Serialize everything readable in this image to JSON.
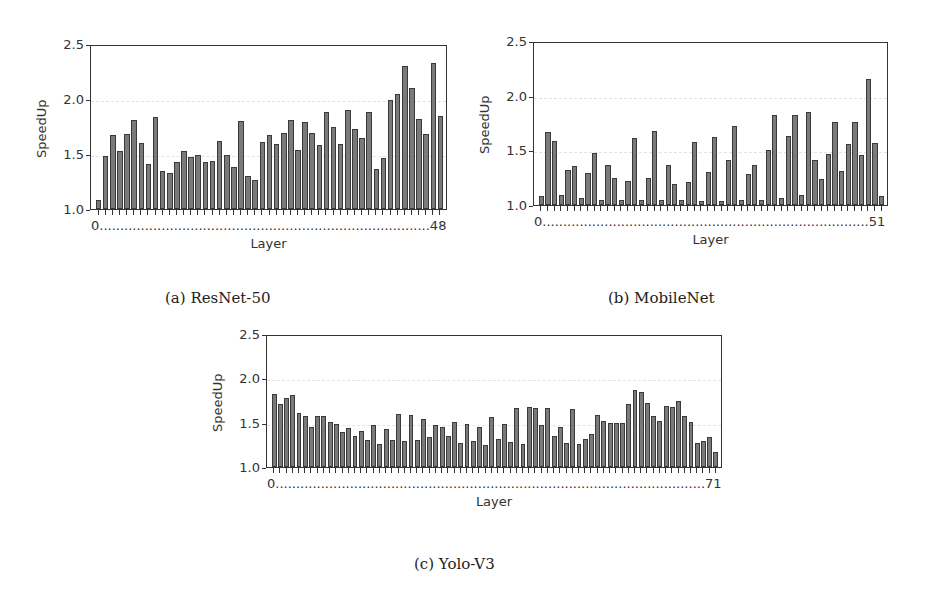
{
  "figure": {
    "captions": [
      "(a) ResNet-50",
      "(b) MobileNet",
      "(c) Yolo-V3"
    ]
  },
  "chart_data": [
    {
      "type": "bar",
      "title": "ResNet-50",
      "caption": "(a) ResNet-50",
      "xlabel": "Layer",
      "ylabel": "SpeedUp",
      "ylim": [
        1.0,
        2.5
      ],
      "yticks": [
        "1.0",
        "1.5",
        "2.0",
        "2.5"
      ],
      "x_start_label": "0",
      "x_end_label": "48",
      "grid": "horizontal dashed",
      "categories": [
        0,
        1,
        2,
        3,
        4,
        5,
        6,
        7,
        8,
        9,
        10,
        11,
        12,
        13,
        14,
        15,
        16,
        17,
        18,
        19,
        20,
        21,
        22,
        23,
        24,
        25,
        26,
        27,
        28,
        29,
        30,
        31,
        32,
        33,
        34,
        35,
        36,
        37,
        38,
        39,
        40,
        41,
        42,
        43,
        44,
        45,
        46,
        47,
        48
      ],
      "values": [
        1.08,
        1.48,
        1.67,
        1.53,
        1.68,
        1.81,
        1.6,
        1.41,
        1.84,
        1.35,
        1.33,
        1.43,
        1.53,
        1.47,
        1.49,
        1.43,
        1.44,
        1.62,
        1.49,
        1.38,
        1.8,
        1.3,
        1.26,
        1.61,
        1.67,
        1.59,
        1.69,
        1.81,
        1.54,
        1.79,
        1.69,
        1.58,
        1.88,
        1.75,
        1.59,
        1.9,
        1.73,
        1.65,
        1.88,
        1.36,
        1.46,
        1.99,
        2.05,
        2.3,
        2.1,
        1.82,
        1.68,
        2.33,
        1.85
      ]
    },
    {
      "type": "bar",
      "title": "MobileNet",
      "caption": "(b) MobileNet",
      "xlabel": "Layer",
      "ylabel": "SpeedUp",
      "ylim": [
        1.0,
        2.5
      ],
      "yticks": [
        "1.0",
        "1.5",
        "2.0",
        "2.5"
      ],
      "x_start_label": "0",
      "x_end_label": "51",
      "grid": "horizontal dashed",
      "categories": [
        0,
        1,
        2,
        3,
        4,
        5,
        6,
        7,
        8,
        9,
        10,
        11,
        12,
        13,
        14,
        15,
        16,
        17,
        18,
        19,
        20,
        21,
        22,
        23,
        24,
        25,
        26,
        27,
        28,
        29,
        30,
        31,
        32,
        33,
        34,
        35,
        36,
        37,
        38,
        39,
        40,
        41,
        42,
        43,
        44,
        45,
        46,
        47,
        48,
        49,
        50,
        51
      ],
      "values": [
        1.08,
        1.67,
        1.59,
        1.09,
        1.32,
        1.36,
        1.06,
        1.29,
        1.48,
        1.05,
        1.37,
        1.25,
        1.05,
        1.22,
        1.61,
        1.05,
        1.25,
        1.68,
        1.05,
        1.37,
        1.19,
        1.05,
        1.21,
        1.58,
        1.04,
        1.3,
        1.62,
        1.04,
        1.41,
        1.72,
        1.05,
        1.28,
        1.37,
        1.05,
        1.5,
        1.82,
        1.06,
        1.63,
        1.82,
        1.09,
        1.85,
        1.41,
        1.24,
        1.47,
        1.76,
        1.31,
        1.56,
        1.76,
        1.46,
        2.15,
        1.57,
        1.08
      ]
    },
    {
      "type": "bar",
      "title": "Yolo-V3",
      "caption": "(c) Yolo-V3",
      "xlabel": "Layer",
      "ylabel": "SpeedUp",
      "ylim": [
        1.0,
        2.5
      ],
      "yticks": [
        "1.0",
        "1.5",
        "2.0",
        "2.5"
      ],
      "x_start_label": "0",
      "x_end_label": "71",
      "grid": "horizontal dashed",
      "categories": [
        0,
        1,
        2,
        3,
        4,
        5,
        6,
        7,
        8,
        9,
        10,
        11,
        12,
        13,
        14,
        15,
        16,
        17,
        18,
        19,
        20,
        21,
        22,
        23,
        24,
        25,
        26,
        27,
        28,
        29,
        30,
        31,
        32,
        33,
        34,
        35,
        36,
        37,
        38,
        39,
        40,
        41,
        42,
        43,
        44,
        45,
        46,
        47,
        48,
        49,
        50,
        51,
        52,
        53,
        54,
        55,
        56,
        57,
        58,
        59,
        60,
        61,
        62,
        63,
        64,
        65,
        66,
        67,
        68,
        69,
        70,
        71
      ],
      "values": [
        1.82,
        1.71,
        1.78,
        1.81,
        1.61,
        1.57,
        1.45,
        1.58,
        1.58,
        1.51,
        1.48,
        1.4,
        1.44,
        1.35,
        1.41,
        1.3,
        1.47,
        1.26,
        1.43,
        1.3,
        1.6,
        1.29,
        1.59,
        1.31,
        1.54,
        1.34,
        1.47,
        1.45,
        1.35,
        1.51,
        1.27,
        1.49,
        1.29,
        1.45,
        1.25,
        1.56,
        1.32,
        1.49,
        1.28,
        1.67,
        1.26,
        1.68,
        1.67,
        1.47,
        1.66,
        1.35,
        1.45,
        1.27,
        1.65,
        1.26,
        1.32,
        1.37,
        1.59,
        1.52,
        1.5,
        1.5,
        1.5,
        1.71,
        1.87,
        1.85,
        1.72,
        1.57,
        1.52,
        1.69,
        1.68,
        1.74,
        1.57,
        1.51,
        1.27,
        1.29,
        1.34,
        1.17
      ]
    }
  ]
}
